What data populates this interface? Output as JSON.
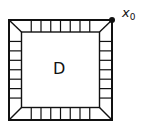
{
  "diagram": {
    "region_label": "D",
    "point_label": {
      "base": "x",
      "subscript": "0"
    },
    "tiles_per_side": 8,
    "colors": {
      "stroke": "#111111",
      "background": "#ffffff"
    }
  }
}
